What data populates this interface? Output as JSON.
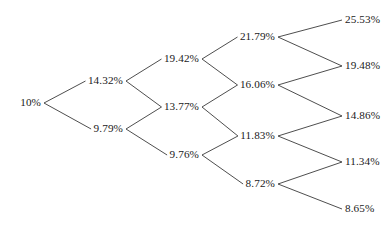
{
  "diagram": {
    "type": "binomial-lattice-tree",
    "title": "",
    "line_color": "#3a3a3a",
    "text_color": "#1a1a1a",
    "background_color": "#ffffff",
    "levels": [
      {
        "index": 0,
        "nodes": [
          {
            "id": "n0_0",
            "label": "10%",
            "x": 41,
            "y": 103,
            "anchor": "right"
          }
        ]
      },
      {
        "index": 1,
        "nodes": [
          {
            "id": "n1_0",
            "label": "14.32%",
            "x": 123,
            "y": 81,
            "anchor": "right"
          },
          {
            "id": "n1_1",
            "label": "9.79%",
            "x": 123,
            "y": 129,
            "anchor": "right"
          }
        ]
      },
      {
        "index": 2,
        "nodes": [
          {
            "id": "n2_0",
            "label": "19.42%",
            "x": 199,
            "y": 59,
            "anchor": "right"
          },
          {
            "id": "n2_1",
            "label": "13.77%",
            "x": 199,
            "y": 107,
            "anchor": "right"
          },
          {
            "id": "n2_2",
            "label": "9.76%",
            "x": 199,
            "y": 155,
            "anchor": "right"
          }
        ]
      },
      {
        "index": 3,
        "nodes": [
          {
            "id": "n3_0",
            "label": "21.79%",
            "x": 275,
            "y": 37,
            "anchor": "right"
          },
          {
            "id": "n3_1",
            "label": "16.06%",
            "x": 275,
            "y": 85,
            "anchor": "right"
          },
          {
            "id": "n3_2",
            "label": "11.83%",
            "x": 275,
            "y": 136,
            "anchor": "right"
          },
          {
            "id": "n3_3",
            "label": "8.72%",
            "x": 275,
            "y": 184,
            "anchor": "right"
          }
        ]
      },
      {
        "index": 4,
        "nodes": [
          {
            "id": "n4_0",
            "label": "25.53%",
            "x": 345,
            "y": 20,
            "anchor": "left"
          },
          {
            "id": "n4_1",
            "label": "19.48%",
            "x": 345,
            "y": 66,
            "anchor": "left"
          },
          {
            "id": "n4_2",
            "label": "14.86%",
            "x": 345,
            "y": 116,
            "anchor": "left"
          },
          {
            "id": "n4_3",
            "label": "11.34%",
            "x": 345,
            "y": 162,
            "anchor": "left"
          },
          {
            "id": "n4_4",
            "label": "8.65%",
            "x": 345,
            "y": 209,
            "anchor": "left"
          }
        ]
      }
    ],
    "edges": [
      {
        "from": "n0_0",
        "to": "n1_0"
      },
      {
        "from": "n0_0",
        "to": "n1_1"
      },
      {
        "from": "n1_0",
        "to": "n2_0"
      },
      {
        "from": "n1_0",
        "to": "n2_1"
      },
      {
        "from": "n1_1",
        "to": "n2_1"
      },
      {
        "from": "n1_1",
        "to": "n2_2"
      },
      {
        "from": "n2_0",
        "to": "n3_0"
      },
      {
        "from": "n2_0",
        "to": "n3_1"
      },
      {
        "from": "n2_1",
        "to": "n3_1"
      },
      {
        "from": "n2_1",
        "to": "n3_2"
      },
      {
        "from": "n2_2",
        "to": "n3_2"
      },
      {
        "from": "n2_2",
        "to": "n3_3"
      },
      {
        "from": "n3_0",
        "to": "n4_0"
      },
      {
        "from": "n3_0",
        "to": "n4_1"
      },
      {
        "from": "n3_1",
        "to": "n4_1"
      },
      {
        "from": "n3_1",
        "to": "n4_2"
      },
      {
        "from": "n3_2",
        "to": "n4_2"
      },
      {
        "from": "n3_2",
        "to": "n4_3"
      },
      {
        "from": "n3_3",
        "to": "n4_3"
      },
      {
        "from": "n3_3",
        "to": "n4_4"
      }
    ],
    "edge_gap": {
      "source_offset": 3,
      "target_offset": 3
    }
  }
}
